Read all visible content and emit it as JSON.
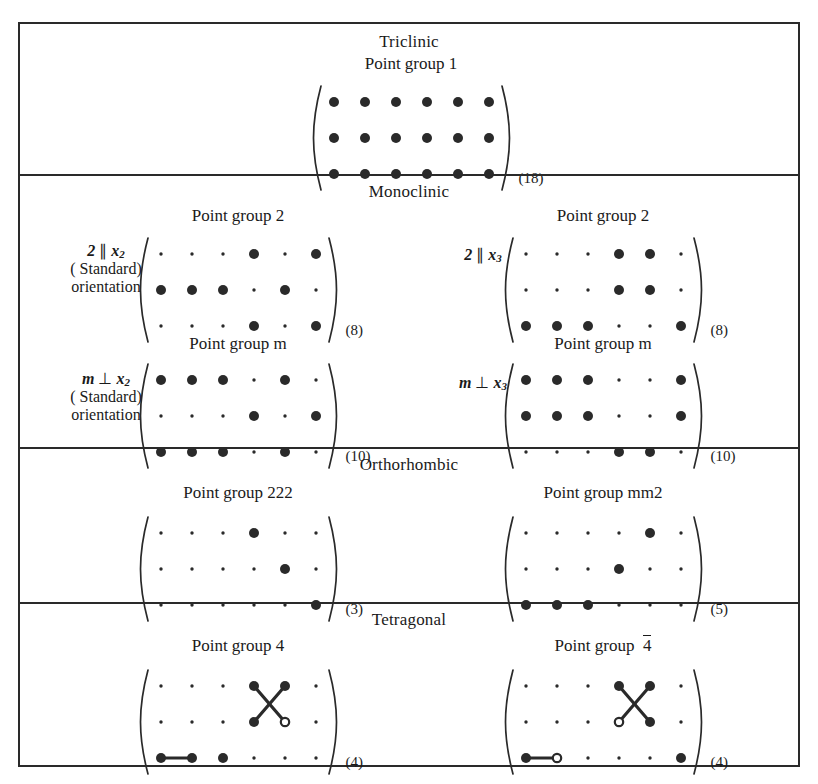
{
  "figure": {
    "grid": {
      "rows": 3,
      "cols": 6
    },
    "legend": {
      "big_dot": "nonzero tensor component",
      "small_dot": "zero component",
      "open_circle": "component equal to negative of connected one",
      "connector": "components numerically equal"
    }
  },
  "sections": [
    {
      "system": "Triclinic",
      "groups": [
        {
          "title": "Point group 1",
          "count": "(18)",
          "side_label": null,
          "matrix": {
            "big": [
              [
                1,
                1,
                1,
                1,
                1,
                1
              ],
              [
                1,
                1,
                1,
                1,
                1,
                1
              ],
              [
                1,
                1,
                1,
                1,
                1,
                1
              ]
            ],
            "open": [],
            "links": []
          }
        }
      ]
    },
    {
      "system": "Monoclinic",
      "groups": [
        {
          "title": "Point group 2",
          "count": "(8)",
          "side_label": {
            "line1_a": "2",
            "line1_op": "∥",
            "line1_var": "x",
            "line1_sub": "2",
            "line2": "( Standard)",
            "line3": "orientation"
          },
          "matrix": {
            "big": [
              [
                0,
                0,
                0,
                1,
                0,
                1
              ],
              [
                1,
                1,
                1,
                0,
                1,
                0
              ],
              [
                0,
                0,
                0,
                1,
                0,
                1
              ]
            ],
            "open": [],
            "links": []
          }
        },
        {
          "title": "Point group 2",
          "count": "(8)",
          "side_label": {
            "line1_a": "2",
            "line1_op": "∥",
            "line1_var": "x",
            "line1_sub": "3",
            "line2": "",
            "line3": ""
          },
          "matrix": {
            "big": [
              [
                0,
                0,
                0,
                1,
                1,
                0
              ],
              [
                0,
                0,
                0,
                1,
                1,
                0
              ],
              [
                1,
                1,
                1,
                0,
                0,
                1
              ]
            ],
            "open": [],
            "links": []
          }
        },
        {
          "title": "Point group m",
          "count": "(10)",
          "side_label": {
            "line1_a": "m",
            "line1_op": "⊥",
            "line1_var": "x",
            "line1_sub": "2",
            "line2": "( Standard)",
            "line3": "orientation"
          },
          "matrix": {
            "big": [
              [
                1,
                1,
                1,
                0,
                1,
                0
              ],
              [
                0,
                0,
                0,
                1,
                0,
                1
              ],
              [
                1,
                1,
                1,
                0,
                1,
                0
              ]
            ],
            "open": [],
            "links": []
          }
        },
        {
          "title": "Point group m",
          "count": "(10)",
          "side_label": {
            "line1_a": "m",
            "line1_op": "⊥",
            "line1_var": "x",
            "line1_sub": "3",
            "line2": "",
            "line3": ""
          },
          "matrix": {
            "big": [
              [
                1,
                1,
                1,
                0,
                0,
                1
              ],
              [
                1,
                1,
                1,
                0,
                0,
                1
              ],
              [
                0,
                0,
                0,
                1,
                1,
                0
              ]
            ],
            "open": [],
            "links": []
          }
        }
      ]
    },
    {
      "system": "Orthorhombic",
      "groups": [
        {
          "title": "Point group 222",
          "count": "(3)",
          "side_label": null,
          "matrix": {
            "big": [
              [
                0,
                0,
                0,
                1,
                0,
                0
              ],
              [
                0,
                0,
                0,
                0,
                1,
                0
              ],
              [
                0,
                0,
                0,
                0,
                0,
                1
              ]
            ],
            "open": [],
            "links": []
          }
        },
        {
          "title": "Point group mm2",
          "count": "(5)",
          "side_label": null,
          "matrix": {
            "big": [
              [
                0,
                0,
                0,
                0,
                1,
                0
              ],
              [
                0,
                0,
                0,
                1,
                0,
                0
              ],
              [
                1,
                1,
                1,
                0,
                0,
                0
              ]
            ],
            "open": [],
            "links": []
          }
        }
      ]
    },
    {
      "system": "Tetragonal",
      "groups": [
        {
          "title": "Point group 4",
          "title_overline": false,
          "count": "(4)",
          "side_label": null,
          "matrix": {
            "big": [
              [
                0,
                0,
                0,
                1,
                1,
                0
              ],
              [
                0,
                0,
                0,
                1,
                0,
                0
              ],
              [
                1,
                1,
                1,
                0,
                0,
                0
              ]
            ],
            "open": [
              [
                1,
                4
              ]
            ],
            "links": [
              [
                [
                  0,
                  3
                ],
                [
                  1,
                  4
                ]
              ],
              [
                [
                  0,
                  4
                ],
                [
                  1,
                  3
                ]
              ],
              [
                [
                  2,
                  0
                ],
                [
                  2,
                  1
                ]
              ]
            ]
          }
        },
        {
          "title": "Point group",
          "title_sym": "4",
          "title_overline": true,
          "count": "(4)",
          "side_label": null,
          "matrix": {
            "big": [
              [
                0,
                0,
                0,
                1,
                1,
                0
              ],
              [
                0,
                0,
                0,
                0,
                1,
                0
              ],
              [
                1,
                0,
                0,
                0,
                0,
                1
              ]
            ],
            "open": [
              [
                1,
                3
              ],
              [
                2,
                1
              ]
            ],
            "links": [
              [
                [
                  0,
                  3
                ],
                [
                  1,
                  4
                ]
              ],
              [
                [
                  0,
                  4
                ],
                [
                  1,
                  3
                ]
              ],
              [
                [
                  2,
                  0
                ],
                [
                  2,
                  1
                ]
              ]
            ]
          }
        }
      ]
    }
  ]
}
